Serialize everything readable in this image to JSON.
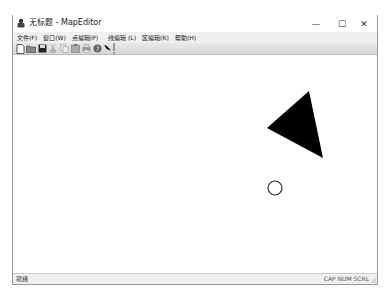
{
  "window": {
    "title": "无标题 - MapEditor",
    "controls": {
      "minimize": "—",
      "maximize": "☐",
      "close": "✕"
    }
  },
  "menu": {
    "items": [
      {
        "label": "文件(F)"
      },
      {
        "label": "窗口(W)"
      },
      {
        "label": "点编辑(P)"
      },
      {
        "label": "线编辑 (L)"
      },
      {
        "label": "区编辑(R)"
      },
      {
        "label": "帮助(H)"
      }
    ]
  },
  "toolbar": {
    "buttons": [
      {
        "icon": "new-file-icon"
      },
      {
        "icon": "open-folder-icon"
      },
      {
        "icon": "save-icon"
      },
      {
        "icon": "cut-icon"
      },
      {
        "icon": "copy-icon"
      },
      {
        "icon": "paste-icon"
      },
      {
        "icon": "print-icon"
      },
      {
        "icon": "about-icon"
      },
      {
        "icon": "pointer-help-icon"
      }
    ]
  },
  "canvas": {
    "shapes": [
      {
        "type": "filled-triangle",
        "points": "296,50 254,87 310,117",
        "fill": "#000000"
      },
      {
        "type": "circle",
        "cx": 262,
        "cy": 147,
        "r": 7,
        "stroke": "#333333"
      }
    ]
  },
  "status": {
    "left": "就绪",
    "right": "CAP NUM SCRL"
  }
}
